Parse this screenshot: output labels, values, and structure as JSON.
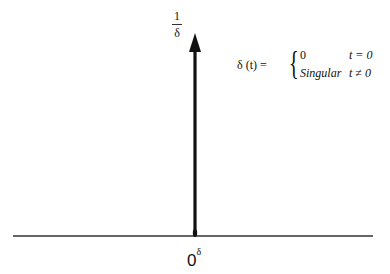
{
  "diagram": {
    "height_label": {
      "numerator": "1",
      "denominator": "δ"
    },
    "formula": {
      "lhs": "δ (t) =",
      "cases": [
        {
          "value": "0",
          "condition": "t = 0"
        },
        {
          "value": "Singular",
          "condition": "t ≠ 0"
        }
      ]
    },
    "origin_label": {
      "base": "0",
      "superscript": "δ"
    },
    "colors": {
      "axis": "#333333",
      "arrow": "#111111",
      "background": "#ffffff"
    }
  }
}
